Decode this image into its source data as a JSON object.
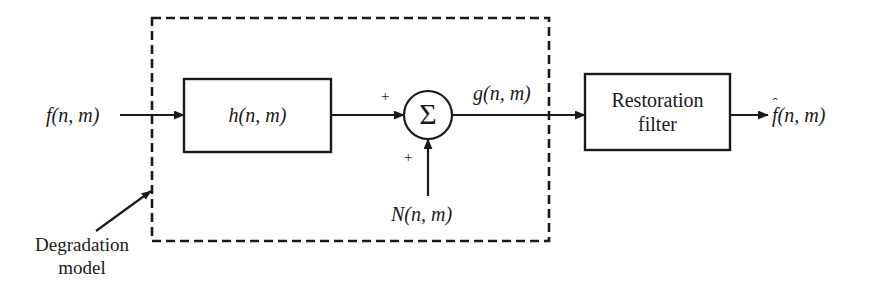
{
  "figure": {
    "type": "block-diagram",
    "background_color": "#ffffff",
    "line_color": "#1a1a1a",
    "text_color": "#1a1a1a"
  },
  "labels": {
    "input_signal": "f(n, m)",
    "input_signal_base": "f",
    "input_signal_args": "(n, m)",
    "degradation_block": "h(n, m)",
    "degradation_block_base": "h",
    "degradation_block_args": "(n, m)",
    "summation_symbol": "Σ",
    "plus_top": "+",
    "plus_bottom": "+",
    "noise_signal": "N(n, m)",
    "noise_signal_base": "N",
    "noise_signal_args": "(n, m)",
    "degraded_signal": "g(n, m)",
    "degraded_signal_base": "g",
    "degraded_signal_args": "(n, m)",
    "restoration_block_line1": "Restoration",
    "restoration_block_line2": "filter",
    "output_signal": "f̂(n, m)",
    "output_signal_base": "f",
    "output_signal_hat": "ˆ",
    "output_signal_args": "(n, m)",
    "annotation_line1": "Degradation",
    "annotation_line2": "model"
  },
  "shapes": {
    "dashed_region_name": "degradation model boundary",
    "dashed_pattern": "9 5",
    "sum_node_shape": "circle"
  }
}
